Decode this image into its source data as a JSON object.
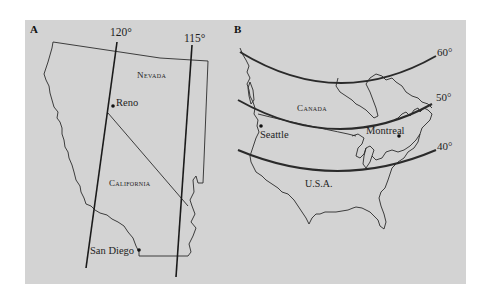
{
  "figure": {
    "background": "#d3d3d3",
    "panels": [
      {
        "id": "A",
        "letter": "A",
        "meridians": [
          {
            "label": "120°"
          },
          {
            "label": "115°"
          }
        ],
        "regions": [
          {
            "label": "Nevada"
          },
          {
            "label": "California"
          }
        ],
        "cities": [
          {
            "label": "Reno"
          },
          {
            "label": "San Diego"
          }
        ]
      },
      {
        "id": "B",
        "letter": "B",
        "parallels": [
          {
            "label": "60°"
          },
          {
            "label": "50°"
          },
          {
            "label": "40°"
          }
        ],
        "regions": [
          {
            "label": "Canada"
          },
          {
            "label": "U.S.A."
          }
        ],
        "cities": [
          {
            "label": "Seattle"
          },
          {
            "label": "Montreal"
          }
        ]
      }
    ]
  }
}
